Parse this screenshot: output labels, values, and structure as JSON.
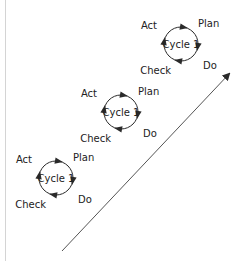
{
  "diagram": {
    "title": "",
    "colors": {
      "stroke": "#2a2a2a",
      "text": "#222222",
      "progress_arrow": "#555555",
      "left_border": "#d4d4d4"
    },
    "cycles": [
      {
        "id": "cycle-bottom",
        "center_label": "Cycle 1",
        "labels": {
          "act": "Act",
          "plan": "Plan",
          "do": "Do",
          "check": "Check"
        }
      },
      {
        "id": "cycle-middle",
        "center_label": "Cycle 1",
        "labels": {
          "act": "Act",
          "plan": "Plan",
          "do": "Do",
          "check": "Check"
        }
      },
      {
        "id": "cycle-top",
        "center_label": "Cycle 1",
        "labels": {
          "act": "Act",
          "plan": "Plan",
          "do": "Do",
          "check": "Check"
        }
      }
    ],
    "progress_arrow": {
      "label": "",
      "direction": "up-right"
    }
  }
}
